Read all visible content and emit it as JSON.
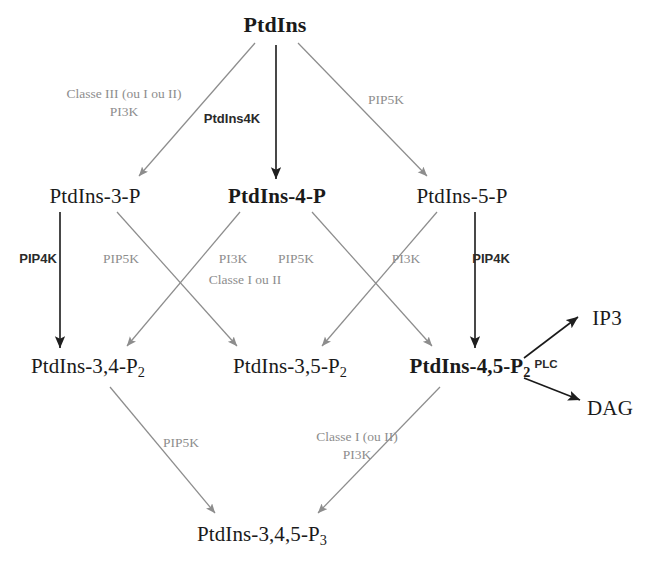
{
  "diagram": {
    "colors": {
      "dark": "#1a1a1a",
      "gray": "#8d8d8d",
      "background": "#ffffff"
    },
    "nodes": [
      {
        "id": "ptdins",
        "label": "PtdIns",
        "sub": "",
        "emphasis": "bold",
        "x": 275,
        "y": 25
      },
      {
        "id": "ptdins3p",
        "label": "PtdIns-3-P",
        "sub": "",
        "emphasis": "normal",
        "x": 95,
        "y": 196
      },
      {
        "id": "ptdins4p",
        "label": "PtdIns-4-P",
        "sub": "",
        "emphasis": "bold",
        "x": 277,
        "y": 196
      },
      {
        "id": "ptdins5p",
        "label": "PtdIns-5-P",
        "sub": "",
        "emphasis": "normal",
        "x": 462,
        "y": 196
      },
      {
        "id": "ptdins34p2",
        "label": "PtdIns-3,4-P",
        "sub": "2",
        "emphasis": "normal",
        "x": 88,
        "y": 368
      },
      {
        "id": "ptdins35p2",
        "label": "PtdIns-3,5-P",
        "sub": "2",
        "emphasis": "normal",
        "x": 290,
        "y": 368
      },
      {
        "id": "ptdins45p2",
        "label": "PtdIns-4,5-P",
        "sub": "2",
        "emphasis": "bold",
        "x": 470,
        "y": 368
      },
      {
        "id": "ip3",
        "label": "IP3",
        "sub": "",
        "emphasis": "normal",
        "x": 607,
        "y": 318
      },
      {
        "id": "dag",
        "label": "DAG",
        "sub": "",
        "emphasis": "normal",
        "x": 610,
        "y": 408
      },
      {
        "id": "ptdins345p3",
        "label": "PtdIns-3,4,5-P",
        "sub": "3",
        "emphasis": "normal",
        "x": 262,
        "y": 536
      }
    ],
    "edges": [
      {
        "id": "e1",
        "from": "ptdins",
        "to": "ptdins3p",
        "enzyme": "PI3K",
        "tone": "gray"
      },
      {
        "id": "e2",
        "from": "ptdins",
        "to": "ptdins4p",
        "enzyme": "PtdIns4K",
        "tone": "dark"
      },
      {
        "id": "e3",
        "from": "ptdins",
        "to": "ptdins5p",
        "enzyme": "PIP5K",
        "tone": "gray"
      },
      {
        "id": "e4",
        "from": "ptdins3p",
        "to": "ptdins34p2",
        "enzyme": "PIP4K",
        "tone": "dark"
      },
      {
        "id": "e5",
        "from": "ptdins3p",
        "to": "ptdins35p2",
        "enzyme": "PIP5K",
        "tone": "gray"
      },
      {
        "id": "e6",
        "from": "ptdins4p",
        "to": "ptdins34p2",
        "enzyme": "PI3K",
        "tone": "gray"
      },
      {
        "id": "e7",
        "from": "ptdins4p",
        "to": "ptdins45p2",
        "enzyme": "PIP5K",
        "tone": "gray"
      },
      {
        "id": "e8",
        "from": "ptdins5p",
        "to": "ptdins35p2",
        "enzyme": "PI3K",
        "tone": "gray"
      },
      {
        "id": "e9",
        "from": "ptdins5p",
        "to": "ptdins45p2",
        "enzyme": "PIP4K",
        "tone": "dark"
      },
      {
        "id": "e10",
        "from": "ptdins34p2",
        "to": "ptdins345p3",
        "enzyme": "PIP5K",
        "tone": "gray"
      },
      {
        "id": "e11",
        "from": "ptdins45p2",
        "to": "ptdins345p3",
        "enzyme": "PI3K",
        "tone": "gray"
      },
      {
        "id": "e12",
        "from": "ptdins45p2",
        "to": "ip3",
        "enzyme": "PLC",
        "tone": "dark"
      },
      {
        "id": "e13",
        "from": "ptdins45p2",
        "to": "dag",
        "enzyme": "PLC",
        "tone": "dark"
      }
    ],
    "edge_labels": [
      {
        "id": "lbl-classe3",
        "line1": "Classe III (ou I ou II)",
        "line2": "PI3K",
        "tone": "gray",
        "x": 124,
        "y": 103
      },
      {
        "id": "lbl-ptdins4k",
        "line1": "PtdIns4K",
        "line2": "",
        "tone": "dark",
        "x": 232,
        "y": 119
      },
      {
        "id": "lbl-pip5k-top",
        "line1": "PIP5K",
        "line2": "",
        "tone": "gray",
        "x": 386,
        "y": 100
      },
      {
        "id": "lbl-pip4k-l",
        "line1": "PIP4K",
        "line2": "",
        "tone": "dark",
        "x": 38,
        "y": 259
      },
      {
        "id": "lbl-pip5k-l",
        "line1": "PIP5K",
        "line2": "",
        "tone": "gray",
        "x": 121,
        "y": 259
      },
      {
        "id": "lbl-pi3k-m1",
        "line1": "PI3K",
        "line2": "",
        "tone": "gray",
        "x": 233,
        "y": 259
      },
      {
        "id": "lbl-pip5k-m",
        "line1": "PIP5K",
        "line2": "",
        "tone": "gray",
        "x": 296,
        "y": 259
      },
      {
        "id": "lbl-classe1-m",
        "line1": "Classe I ou II",
        "line2": "",
        "tone": "gray",
        "x": 245,
        "y": 280
      },
      {
        "id": "lbl-pi3k-r",
        "line1": "PI3K",
        "line2": "",
        "tone": "gray",
        "x": 406,
        "y": 259
      },
      {
        "id": "lbl-pip4k-r",
        "line1": "PIP4K",
        "line2": "",
        "tone": "dark",
        "x": 491,
        "y": 259
      },
      {
        "id": "lbl-plc",
        "line1": "PLC",
        "line2": "",
        "tone": "dark",
        "x": 546,
        "y": 365
      },
      {
        "id": "lbl-pip5k-b",
        "line1": "PIP5K",
        "line2": "",
        "tone": "gray",
        "x": 181,
        "y": 443
      },
      {
        "id": "lbl-classe1-b",
        "line1": "Classe I (ou II)",
        "line2": "PI3K",
        "tone": "gray",
        "x": 357,
        "y": 446
      }
    ],
    "arrows": [
      {
        "id": "a1",
        "x1": 255,
        "y1": 43,
        "x2": 139,
        "y2": 176,
        "tone": "gray"
      },
      {
        "id": "a2",
        "x1": 276,
        "y1": 45,
        "x2": 276,
        "y2": 179,
        "tone": "dark"
      },
      {
        "id": "a3",
        "x1": 298,
        "y1": 43,
        "x2": 427,
        "y2": 176,
        "tone": "gray"
      },
      {
        "id": "a4",
        "x1": 60,
        "y1": 212,
        "x2": 60,
        "y2": 348,
        "tone": "dark"
      },
      {
        "id": "a5",
        "x1": 117,
        "y1": 212,
        "x2": 237,
        "y2": 346,
        "tone": "gray"
      },
      {
        "id": "a6",
        "x1": 240,
        "y1": 212,
        "x2": 127,
        "y2": 346,
        "tone": "gray"
      },
      {
        "id": "a7",
        "x1": 312,
        "y1": 212,
        "x2": 432,
        "y2": 346,
        "tone": "gray"
      },
      {
        "id": "a8",
        "x1": 437,
        "y1": 212,
        "x2": 322,
        "y2": 346,
        "tone": "gray"
      },
      {
        "id": "a9",
        "x1": 475,
        "y1": 212,
        "x2": 475,
        "y2": 348,
        "tone": "dark"
      },
      {
        "id": "a10",
        "x1": 110,
        "y1": 387,
        "x2": 215,
        "y2": 513,
        "tone": "gray"
      },
      {
        "id": "a11",
        "x1": 440,
        "y1": 387,
        "x2": 318,
        "y2": 513,
        "tone": "gray"
      },
      {
        "id": "a12",
        "x1": 524,
        "y1": 358,
        "x2": 578,
        "y2": 317,
        "tone": "dark"
      },
      {
        "id": "a13",
        "x1": 524,
        "y1": 378,
        "x2": 580,
        "y2": 400,
        "tone": "dark"
      }
    ]
  }
}
